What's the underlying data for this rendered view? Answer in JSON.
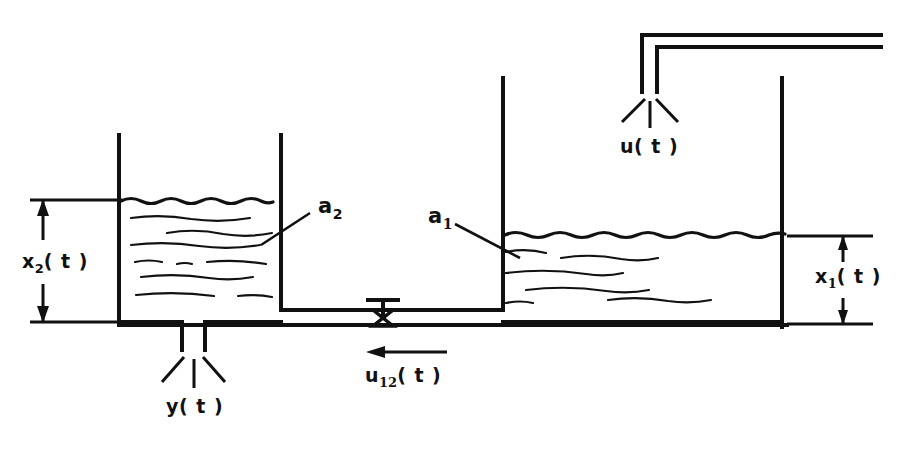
{
  "figure": {
    "type": "engineering-schematic",
    "background_color": "#ffffff",
    "line_color": "#111111"
  },
  "labels": {
    "level_tank2": {
      "base": "x",
      "sub": "2",
      "suffix": "( t )",
      "full": "x₂(t)"
    },
    "level_tank1": {
      "base": "x",
      "sub": "1",
      "suffix": "( t )",
      "full": "x₁(t)"
    },
    "area_tank2": {
      "base": "a",
      "sub": "2",
      "suffix": "",
      "full": "a₂"
    },
    "area_tank1": {
      "base": "a",
      "sub": "1",
      "suffix": "",
      "full": "a₁"
    },
    "inflow": {
      "base": "u",
      "sub": "",
      "suffix": "( t )",
      "full": "u(t)"
    },
    "interflow": {
      "base": "u",
      "sub": "12",
      "suffix": "( t )",
      "full": "u₁₂(t)"
    },
    "outflow": {
      "base": "y",
      "sub": "",
      "suffix": "( t )",
      "full": "y(t)"
    }
  },
  "components": {
    "tank_left": {
      "name": "tank 2",
      "area_symbol": "a₂",
      "level_symbol": "x₂(t)"
    },
    "tank_right": {
      "name": "tank 1",
      "area_symbol": "a₁",
      "level_symbol": "x₁(t)"
    },
    "valve": {
      "name": "interconnecting valve",
      "symbol": "butterfly-valve",
      "flow_symbol": "u₁₂(t)"
    },
    "inlet_pipe": {
      "name": "inlet pipe",
      "flow_symbol": "u(t)"
    },
    "outlet_spout": {
      "name": "outlet spout",
      "flow_symbol": "y(t)"
    }
  },
  "flow_directions": {
    "interflow_arrow": "left",
    "inflow_spray": "down",
    "outflow_spray": "down"
  }
}
